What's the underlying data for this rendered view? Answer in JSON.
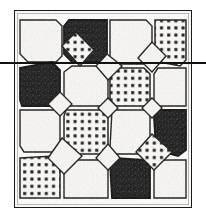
{
  "figure": {
    "medium": "halftone scan of a printed engraving",
    "background_color": "#ffffff",
    "ink_color": "#1a1a1a"
  },
  "plate": {
    "x": 14,
    "y": 10,
    "width": 178,
    "height": 198,
    "border_color": "#1a1a1a",
    "fill_color": "#fdfdfc",
    "rows": 4,
    "columns": 4
  },
  "crossing_rule": {
    "name": "horizontal-rule",
    "y": 62,
    "x_start": 0,
    "x_end": 206,
    "thickness": 2,
    "color": "#121212"
  },
  "fills": {
    "light": {
      "label": "plain light tile",
      "color": "#f7f6f3"
    },
    "dark": {
      "label": "dark mottled tile",
      "color": "#1c1c1c"
    },
    "dotted": {
      "label": "dotted / studded tile",
      "color": "#fbfaf7",
      "dot_color": "#141414"
    }
  },
  "octagon_tiles": [
    {
      "row": 1,
      "col": 1,
      "fill": "light"
    },
    {
      "row": 1,
      "col": 2,
      "fill": "dark"
    },
    {
      "row": 1,
      "col": 3,
      "fill": "light"
    },
    {
      "row": 1,
      "col": 4,
      "fill": "dotted"
    },
    {
      "row": 2,
      "col": 1,
      "fill": "dark"
    },
    {
      "row": 2,
      "col": 2,
      "fill": "light"
    },
    {
      "row": 2,
      "col": 3,
      "fill": "dotted"
    },
    {
      "row": 2,
      "col": 4,
      "fill": "light"
    },
    {
      "row": 3,
      "col": 1,
      "fill": "light"
    },
    {
      "row": 3,
      "col": 2,
      "fill": "dotted"
    },
    {
      "row": 3,
      "col": 3,
      "fill": "light"
    },
    {
      "row": 3,
      "col": 4,
      "fill": "dark"
    },
    {
      "row": 4,
      "col": 1,
      "fill": "dotted"
    },
    {
      "row": 4,
      "col": 2,
      "fill": "light"
    },
    {
      "row": 4,
      "col": 3,
      "fill": "dark"
    },
    {
      "row": 4,
      "col": 4,
      "fill": "light"
    }
  ],
  "diamond_tiles": [
    {
      "row": 1,
      "col": 1,
      "fill": "dotted"
    },
    {
      "row": 1,
      "col": 2,
      "fill": "light"
    },
    {
      "row": 1,
      "col": 3,
      "fill": "light"
    },
    {
      "row": 2,
      "col": 1,
      "fill": "light"
    },
    {
      "row": 2,
      "col": 2,
      "fill": "light"
    },
    {
      "row": 2,
      "col": 3,
      "fill": "light"
    },
    {
      "row": 3,
      "col": 1,
      "fill": "light"
    },
    {
      "row": 3,
      "col": 2,
      "fill": "light"
    },
    {
      "row": 3,
      "col": 3,
      "fill": "dotted"
    }
  ]
}
